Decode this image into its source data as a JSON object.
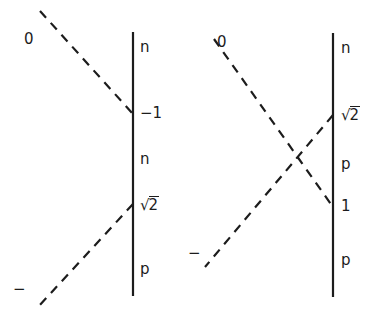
{
  "figure": {
    "background_color": "#ffffff",
    "ink_color": "#1c1c1c",
    "width": 391,
    "height": 321,
    "diagrams": [
      {
        "name": "left-diagram",
        "vertical_line": {
          "x": 133,
          "y1": 32,
          "y2": 296
        },
        "dashed_lines": [
          {
            "name": "incoming-zero-line",
            "x1": 40,
            "y1": 11,
            "x2": 133,
            "y2": 114
          },
          {
            "name": "outgoing-minus-line",
            "x1": 133,
            "y1": 204,
            "x2": 38,
            "y2": 307
          }
        ],
        "labels": [
          {
            "name": "label-zero",
            "text": "0",
            "x": 24,
            "y": 32,
            "kind": "plain"
          },
          {
            "name": "label-n-top",
            "text": "n",
            "x": 140,
            "y": 40,
            "kind": "plain"
          },
          {
            "name": "label-minus-one",
            "text": "−1",
            "x": 140,
            "y": 106,
            "kind": "plain"
          },
          {
            "name": "label-n-mid",
            "text": "n",
            "x": 140,
            "y": 152,
            "kind": "plain"
          },
          {
            "name": "label-sqrt-two",
            "text": "2",
            "x": 140,
            "y": 196,
            "kind": "radical"
          },
          {
            "name": "label-p-bottom",
            "text": "p",
            "x": 140,
            "y": 262,
            "kind": "plain"
          },
          {
            "name": "label-minus",
            "text": "−",
            "x": 13,
            "y": 282,
            "kind": "plain"
          }
        ]
      },
      {
        "name": "right-diagram",
        "vertical_line": {
          "x": 333,
          "y1": 33,
          "y2": 297
        },
        "dashed_lines": [
          {
            "name": "incoming-zero-line",
            "x1": 214,
            "y1": 39,
            "x2": 333,
            "y2": 207
          },
          {
            "name": "outgoing-minus-line",
            "x1": 333,
            "y1": 115,
            "x2": 205,
            "y2": 267
          }
        ],
        "labels": [
          {
            "name": "label-zero",
            "text": "0",
            "x": 217,
            "y": 35,
            "kind": "plain"
          },
          {
            "name": "label-n-top",
            "text": "n",
            "x": 341,
            "y": 41,
            "kind": "plain"
          },
          {
            "name": "label-sqrt-two",
            "text": "2",
            "x": 341,
            "y": 106,
            "kind": "radical"
          },
          {
            "name": "label-p-mid",
            "text": "p",
            "x": 341,
            "y": 157,
            "kind": "plain"
          },
          {
            "name": "label-one",
            "text": "1",
            "x": 341,
            "y": 199,
            "kind": "plain"
          },
          {
            "name": "label-p-bottom",
            "text": "p",
            "x": 341,
            "y": 253,
            "kind": "plain"
          },
          {
            "name": "label-minus",
            "text": "−",
            "x": 188,
            "y": 246,
            "kind": "plain"
          }
        ]
      }
    ]
  }
}
